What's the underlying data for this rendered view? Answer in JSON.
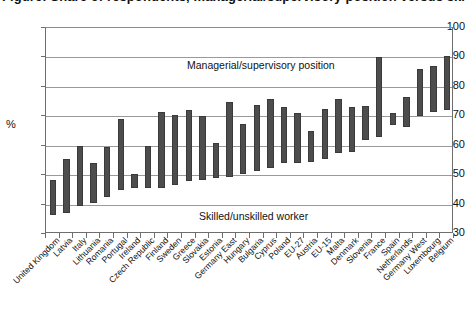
{
  "title": "Figure: Share of respondents, managerial/supervisory position versus skilled/unskilled worker, by country",
  "axis": {
    "y_label": "%",
    "y_ticks": [
      100,
      90,
      80,
      70,
      60,
      50,
      40,
      30
    ]
  },
  "annotations": {
    "upper": "Managerial/supervisory position",
    "lower": "Skilled/unskilled worker"
  },
  "colors": {
    "bar": "#4d4d4d",
    "bar_edge": "#3a3a3a",
    "grid": "#9a9a9a",
    "axis": "#6e6e6e",
    "text": "#111111",
    "background": "#ffffff"
  },
  "chart_data": {
    "type": "bar",
    "subtype": "floating-range-bar",
    "title": "Managerial/supervisory position versus skilled/unskilled worker",
    "xlabel": "",
    "ylabel": "%",
    "ylim": [
      30,
      100
    ],
    "ytick_step": 10,
    "grid": true,
    "legend": false,
    "annotations": [
      {
        "text": "Managerial/supervisory position",
        "y": 93
      },
      {
        "text": "Skilled/unskilled worker",
        "y": 40
      }
    ],
    "categories": [
      "United Kingdom",
      "Latvia",
      "Italy",
      "Lithuania",
      "Romania",
      "Portugal",
      "Ireland",
      "Czech Republic",
      "Finland",
      "Sweden",
      "Greece",
      "Slovakia",
      "Estonia",
      "Germany East",
      "Hungary",
      "Bulgaria",
      "Cyprus",
      "Poland",
      "EU-27",
      "Austria",
      "EU-15",
      "Malta",
      "Denmark",
      "Slovenia",
      "France",
      "Spain",
      "Netherlands",
      "Germany West",
      "Luxembourg",
      "Belgium"
    ],
    "series": [
      {
        "name": "Skilled/unskilled worker (low end)",
        "values": [
          36.5,
          37.0,
          39.5,
          40.5,
          42.5,
          45.0,
          45.5,
          45.5,
          45.5,
          46.5,
          48.0,
          48.5,
          49.0,
          49.5,
          50.5,
          51.5,
          52.5,
          54.0,
          54.0,
          54.5,
          55.5,
          57.5,
          58.0,
          62.0,
          63.0,
          67.0,
          66.5,
          70.0,
          71.5,
          72.0
        ]
      },
      {
        "name": "Managerial/supervisory position (high end)",
        "values": [
          48.5,
          55.5,
          60.0,
          54.0,
          59.5,
          69.0,
          50.5,
          60.0,
          71.5,
          70.5,
          72.0,
          70.0,
          61.0,
          75.0,
          67.5,
          74.0,
          76.0,
          73.0,
          71.0,
          65.0,
          72.5,
          76.0,
          73.0,
          73.5,
          90.0,
          71.0,
          76.5,
          86.0,
          87.0,
          90.5
        ]
      }
    ]
  }
}
